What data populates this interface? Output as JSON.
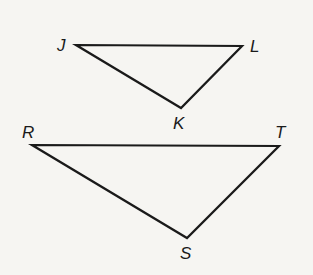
{
  "diagram": {
    "type": "geometry-triangles",
    "background": "#f6f5f2",
    "stroke_color": "#1a1a1a",
    "triangles": [
      {
        "name": "JKL",
        "vertices": [
          {
            "label": "J",
            "x": 76,
            "y": 45,
            "label_x": 57,
            "label_y": 51
          },
          {
            "label": "L",
            "x": 242,
            "y": 46,
            "label_x": 250,
            "label_y": 52
          },
          {
            "label": "K",
            "x": 181,
            "y": 108,
            "label_x": 173,
            "label_y": 129
          }
        ]
      },
      {
        "name": "RST",
        "vertices": [
          {
            "label": "R",
            "x": 32,
            "y": 145,
            "label_x": 22,
            "label_y": 138
          },
          {
            "label": "T",
            "x": 279,
            "y": 146,
            "label_x": 275,
            "label_y": 138
          },
          {
            "label": "S",
            "x": 187,
            "y": 238,
            "label_x": 180,
            "label_y": 259
          }
        ]
      }
    ]
  }
}
